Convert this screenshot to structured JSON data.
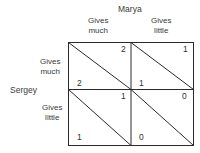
{
  "column_player": {
    "name": "Marya",
    "strategies": [
      "Gives\nmuch",
      "Gives\nlittle"
    ],
    "strategy_lines": [
      [
        "Gives",
        "much"
      ],
      [
        "Gives",
        "little"
      ]
    ]
  },
  "row_player": {
    "name": "Sergey",
    "strategies": [
      "Gives\nmuch",
      "Gives\nlittle"
    ],
    "strategy_lines": [
      [
        "Gives",
        "much"
      ],
      [
        "Gives",
        "little"
      ]
    ]
  },
  "payoffs": [
    [
      {
        "marya": "2",
        "sergey": "2"
      },
      {
        "marya": "1",
        "sergey": "1"
      }
    ],
    [
      {
        "marya": "1",
        "sergey": "1"
      },
      {
        "marya": "0",
        "sergey": "0"
      }
    ]
  ],
  "colors": {
    "line": "#2a2a2a",
    "text": "#3a3a3a"
  }
}
